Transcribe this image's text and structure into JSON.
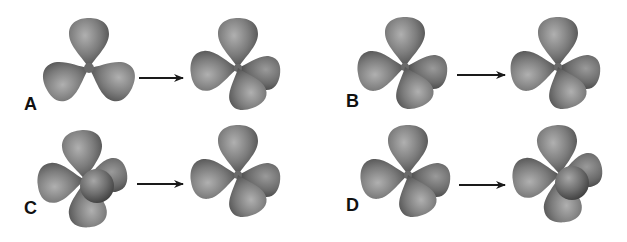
{
  "figure": {
    "type": "orbital-geometry-transitions",
    "panels": [
      {
        "label": "A",
        "from": "trigonal-planar-3-lobes",
        "to": "4-lobes-tetrahedral"
      },
      {
        "label": "B",
        "from": "4-lobes",
        "to": "4-lobes"
      },
      {
        "label": "C",
        "from": "5-lobes",
        "to": "4-lobes"
      },
      {
        "label": "D",
        "from": "4-lobes",
        "to": "5-lobes"
      }
    ],
    "arrow_icon": "right-arrow-icon",
    "colors": {
      "lobe_dark": "#4a4a4a",
      "lobe_mid": "#7a7a7a",
      "lobe_light": "#a8a8a8",
      "arrow": "#1a1a1a",
      "label": "#111111",
      "background": "#ffffff"
    }
  }
}
